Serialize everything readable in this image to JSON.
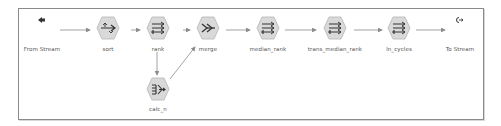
{
  "diagram": {
    "type": "stream-workflow",
    "colors": {
      "border": "#8a8a8a",
      "node_fill": "#d9d9d9",
      "node_stroke": "#b5b5b5",
      "icon": "#333333",
      "link": "#8c8c8c",
      "label": "#555555"
    },
    "nodes": [
      {
        "id": "from_stream",
        "label": "From Stream",
        "kind": "input-terminal",
        "icon": "stream-in-icon"
      },
      {
        "id": "sort",
        "label": "sort",
        "kind": "sort",
        "icon": "sort-icon"
      },
      {
        "id": "rank",
        "label": "rank",
        "kind": "derive",
        "icon": "derive-icon"
      },
      {
        "id": "merge",
        "label": "merge",
        "kind": "merge",
        "icon": "merge-icon"
      },
      {
        "id": "median_rank",
        "label": "median_rank",
        "kind": "derive",
        "icon": "derive-icon"
      },
      {
        "id": "trans_median_rank",
        "label": "trans_median_rank",
        "kind": "derive",
        "icon": "derive-icon"
      },
      {
        "id": "ln_cycles",
        "label": "ln_cycles",
        "kind": "derive",
        "icon": "derive-icon"
      },
      {
        "id": "to_stream",
        "label": "To Stream",
        "kind": "output-terminal",
        "icon": "stream-out-icon"
      },
      {
        "id": "calc_n",
        "label": "calc_n",
        "kind": "aggregate",
        "icon": "aggregate-icon"
      }
    ],
    "edges": [
      {
        "from": "from_stream",
        "to": "sort"
      },
      {
        "from": "sort",
        "to": "rank"
      },
      {
        "from": "rank",
        "to": "merge"
      },
      {
        "from": "rank",
        "to": "calc_n"
      },
      {
        "from": "calc_n",
        "to": "merge"
      },
      {
        "from": "merge",
        "to": "median_rank"
      },
      {
        "from": "median_rank",
        "to": "trans_median_rank"
      },
      {
        "from": "trans_median_rank",
        "to": "ln_cycles"
      },
      {
        "from": "ln_cycles",
        "to": "to_stream"
      }
    ]
  }
}
